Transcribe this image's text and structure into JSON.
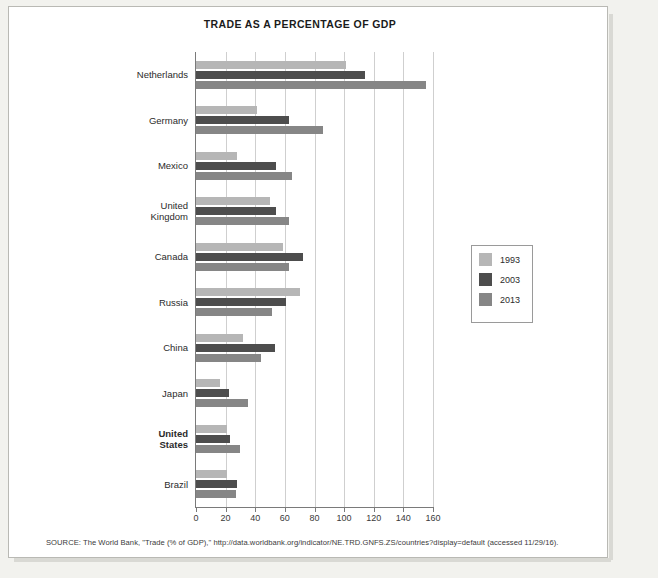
{
  "chart_data": {
    "type": "bar",
    "orientation": "horizontal",
    "title": "TRADE AS A PERCENTAGE OF GDP",
    "xlabel": "",
    "ylabel": "",
    "xlim": [
      0,
      160
    ],
    "xticks": [
      0,
      20,
      40,
      60,
      80,
      100,
      120,
      140,
      160
    ],
    "grid": true,
    "legend_position": "right",
    "categories": [
      "Netherlands",
      "Germany",
      "Mexico",
      "United\nKingdom",
      "Canada",
      "Russia",
      "China",
      "Japan",
      "United\nStates",
      "Brazil"
    ],
    "series": [
      {
        "name": "1993",
        "color": "#b6b6b6",
        "values": [
          101,
          41,
          28,
          50,
          59,
          70,
          32,
          16,
          21,
          21
        ]
      },
      {
        "name": "2003",
        "color": "#4d4d4d",
        "values": [
          114,
          63,
          54,
          54,
          72,
          61,
          53,
          22,
          23,
          28
        ]
      },
      {
        "name": "2013",
        "color": "#868686",
        "values": [
          155,
          86,
          65,
          63,
          63,
          51,
          44,
          35,
          30,
          27
        ]
      }
    ]
  },
  "legend": {
    "items": [
      {
        "label": "1993",
        "color": "#b6b6b6"
      },
      {
        "label": "2003",
        "color": "#4d4d4d"
      },
      {
        "label": "2013",
        "color": "#868686"
      }
    ]
  },
  "source": {
    "text": "SOURCE: The World Bank, \"Trade (% of GDP),\" http://data.worldbank.org/indicator/NE.TRD.GNFS.ZS/countries?display=default (accessed 11/29/16)."
  }
}
